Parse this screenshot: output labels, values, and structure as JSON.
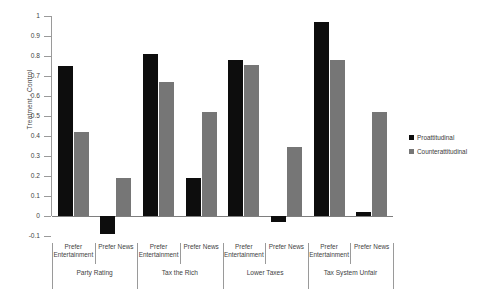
{
  "chart_data": {
    "type": "bar",
    "title": "",
    "xlabel": "",
    "ylabel": "Treatment - Control",
    "ylim": [
      -0.1,
      1
    ],
    "ytick_labels": [
      "1",
      "0.9",
      "0.8",
      "0.7",
      "0.6",
      "0.5",
      "0.4",
      "0.3",
      "0.2",
      "0.1",
      "0",
      "-0.1"
    ],
    "ytick_values": [
      1,
      0.9,
      0.8,
      0.7,
      0.6,
      0.5,
      0.4,
      0.3,
      0.2,
      0.1,
      0,
      -0.1
    ],
    "grid": false,
    "legend_position": "right",
    "legend": [
      "Proattitudinal",
      "Counterattitudinal"
    ],
    "groups": [
      {
        "label": "Party Rating",
        "subgroups": [
          {
            "label": "Prefer Entertainment",
            "values": {
              "Proattitudinal": 0.75,
              "Counterattitudinal": 0.42
            }
          },
          {
            "label": "Prefer News",
            "values": {
              "Proattitudinal": -0.09,
              "Counterattitudinal": 0.19
            }
          }
        ]
      },
      {
        "label": "Tax the Rich",
        "subgroups": [
          {
            "label": "Prefer Entertainment",
            "values": {
              "Proattitudinal": 0.81,
              "Counterattitudinal": 0.67
            }
          },
          {
            "label": "Prefer News",
            "values": {
              "Proattitudinal": 0.19,
              "Counterattitudinal": 0.52
            }
          }
        ]
      },
      {
        "label": "Lower Taxes",
        "subgroups": [
          {
            "label": "Prefer Entertainment",
            "values": {
              "Proattitudinal": 0.78,
              "Counterattitudinal": 0.755
            }
          },
          {
            "label": "Prefer News",
            "values": {
              "Proattitudinal": -0.03,
              "Counterattitudinal": 0.345
            }
          }
        ]
      },
      {
        "label": "Tax System Unfair",
        "subgroups": [
          {
            "label": "Prefer Entertainment",
            "values": {
              "Proattitudinal": 0.97,
              "Counterattitudinal": 0.78
            }
          },
          {
            "label": "Prefer News",
            "values": {
              "Proattitudinal": 0.02,
              "Counterattitudinal": 0.52
            }
          }
        ]
      }
    ],
    "series_colors": {
      "Proattitudinal": "#0d0d0d",
      "Counterattitudinal": "#767676"
    }
  },
  "axis": {
    "y_title": "Treatment - Control"
  },
  "legend": {
    "items": [
      {
        "name": "Proattitudinal"
      },
      {
        "name": "Counterattitudinal"
      }
    ]
  }
}
